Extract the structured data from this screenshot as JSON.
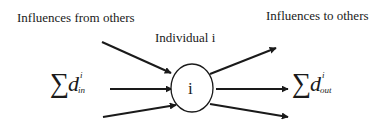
{
  "labels": {
    "influences_from": "Influences from others",
    "individual": "Individual i",
    "influences_to": "Influences to others"
  },
  "node": {
    "label": "i"
  },
  "formulas": {
    "inflow": {
      "sum": "∑",
      "var": "d",
      "superscript": "i",
      "subscript": "in"
    },
    "outflow": {
      "sum": "∑",
      "var": "d",
      "superscript": "i",
      "subscript": "out"
    }
  },
  "arrows": {
    "incoming_count": 3,
    "outgoing_count": 3
  },
  "colors": {
    "stroke": "#1a1a1a",
    "background": "#ffffff"
  }
}
